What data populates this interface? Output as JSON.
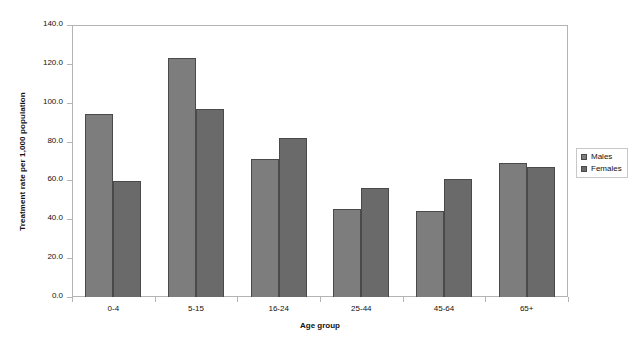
{
  "chart_data": {
    "type": "bar",
    "title": "",
    "xlabel": "Age group",
    "ylabel": "Treatment rate per 1,000 population",
    "categories": [
      "0-4",
      "5-15",
      "16-24",
      "25-44",
      "45-64",
      "65+"
    ],
    "series": [
      {
        "name": "Males",
        "values": [
          94.0,
          123.0,
          71.0,
          45.5,
          44.5,
          69.0
        ],
        "color": "#7d7d7d"
      },
      {
        "name": "Females",
        "values": [
          59.5,
          97.0,
          82.0,
          56.0,
          60.5,
          67.0
        ],
        "color": "#6a6a6a"
      }
    ],
    "ylim": [
      0.0,
      140.0
    ],
    "ytick_labels": [
      "0.0",
      "20.0",
      "40.0",
      "60.0",
      "80.0",
      "100.0",
      "120.0",
      "140.0"
    ],
    "ytick_values": [
      0,
      20,
      40,
      60,
      80,
      100,
      120,
      140
    ],
    "grid": false,
    "legend_position": "right",
    "legend_entries": [
      "Males",
      "Females"
    ]
  }
}
